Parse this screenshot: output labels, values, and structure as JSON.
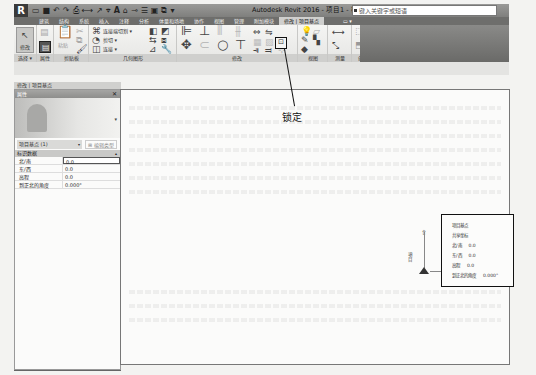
{
  "titlebar": {
    "app_logo": "R",
    "title": "Autodesk Revit 2016 -   项目1 - 楼层平面: 场地",
    "search_placeholder": "键入关键字或短语",
    "qat_icons": [
      "open-icon",
      "save-icon",
      "undo-icon",
      "redo-icon",
      "print-icon",
      "measure-icon",
      "dimension-icon",
      "tag-icon",
      "text-icon",
      "3d-view-icon",
      "section-icon",
      "thin-lines-icon",
      "close-hidden-icon",
      "switch-windows-icon"
    ]
  },
  "ribbon": {
    "tabs": [
      {
        "label": "建筑",
        "active": false
      },
      {
        "label": "结构",
        "active": false
      },
      {
        "label": "系统",
        "active": false
      },
      {
        "label": "插入",
        "active": false
      },
      {
        "label": "注释",
        "active": false
      },
      {
        "label": "分析",
        "active": false
      },
      {
        "label": "体量和场地",
        "active": false
      },
      {
        "label": "协作",
        "active": false
      },
      {
        "label": "视图",
        "active": false
      },
      {
        "label": "管理",
        "active": false
      },
      {
        "label": "附加模块",
        "active": false
      },
      {
        "label": "修改 | 项目基点",
        "active": true
      },
      {
        "label": "▭ ▾",
        "active": false
      }
    ],
    "panels": {
      "select": {
        "label": "选择 ▾",
        "modify_label": "修改"
      },
      "properties": {
        "label": "属性"
      },
      "clipboard": {
        "label": "剪贴板",
        "paste_label": "粘贴"
      },
      "geometry": {
        "label": "几何图形",
        "items": [
          "连接端切割 ▾",
          "剪切 ▾",
          "连接 ▾"
        ]
      },
      "modify": {
        "label": "修改"
      },
      "view": {
        "label": "视图"
      },
      "measure": {
        "label": "测量"
      },
      "create": {
        "label": "创建"
      }
    }
  },
  "properties_palette": {
    "context_label": "修改 | 项目基点",
    "header": "属性",
    "close": "✕",
    "filter_value": "项目基点 (1)",
    "edit_type": "编辑类型",
    "group": "标识数据",
    "rows": [
      {
        "name": "北/南",
        "value": "0.0"
      },
      {
        "name": "东/西",
        "value": "0.0"
      },
      {
        "name": "高程",
        "value": "0.0"
      },
      {
        "name": "到正北的角度",
        "value": "0.000°"
      }
    ]
  },
  "canvas": {
    "callout": "锁定",
    "base_point_side_label": "項目",
    "info_box": {
      "lines": [
        {
          "label": "项目基点",
          "value": ""
        },
        {
          "label": "共享坐标",
          "value": ""
        },
        {
          "label": "北/南",
          "value": "0.0"
        },
        {
          "label": "东/西",
          "value": "0.0"
        },
        {
          "label": "高程",
          "value": "0.0"
        },
        {
          "label": "到正北的角度",
          "value": "0.000°"
        }
      ]
    }
  },
  "colors": {
    "titlebar": "#8c8c8a",
    "tabs_bg": "#6e6e6c",
    "active_tab": "#cfcfcd",
    "ribbon_bg": "#eeeeec",
    "canvas_bg": "#fbfbfa"
  }
}
